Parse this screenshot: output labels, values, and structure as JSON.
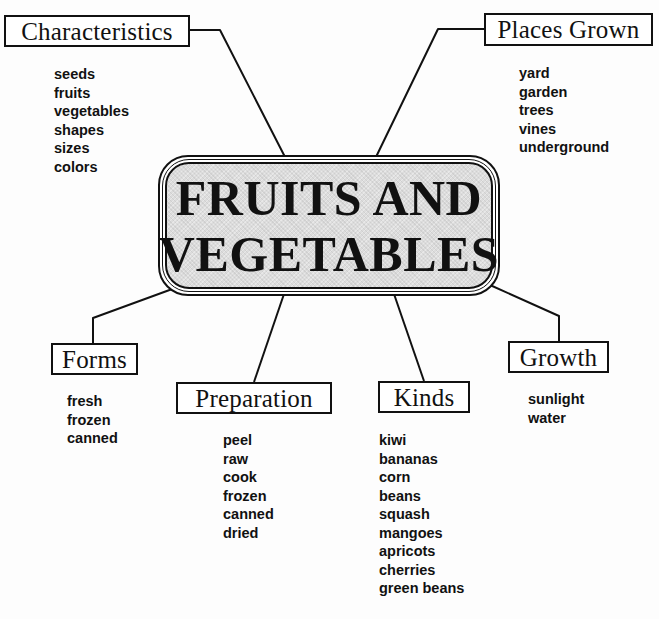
{
  "title": {
    "line1": "FRUITS AND",
    "line2": "VEGETABLES"
  },
  "colors": {
    "ink": "#111111",
    "center_fill": "#dcdcdc",
    "background": "#fdfdfd"
  },
  "branches": {
    "characteristics": {
      "label": "Characteristics",
      "items": [
        "seeds",
        "fruits",
        "vegetables",
        "shapes",
        "sizes",
        "colors"
      ]
    },
    "places_grown": {
      "label": "Places Grown",
      "items": [
        "yard",
        "garden",
        "trees",
        "vines",
        "underground"
      ]
    },
    "forms": {
      "label": "Forms",
      "items": [
        "fresh",
        "frozen",
        "canned"
      ]
    },
    "preparation": {
      "label": "Preparation",
      "items": [
        "peel",
        "raw",
        "cook",
        "frozen",
        "canned",
        "dried"
      ]
    },
    "kinds": {
      "label": "Kinds",
      "items": [
        "kiwi",
        "bananas",
        "corn",
        "beans",
        "squash",
        "mangoes",
        "apricots",
        "cherries",
        "green beans"
      ]
    },
    "growth": {
      "label": "Growth",
      "items": [
        "sunlight",
        "water"
      ]
    }
  }
}
